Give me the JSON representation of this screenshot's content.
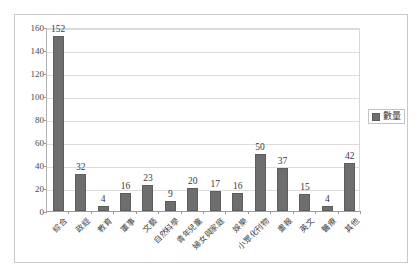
{
  "chart_data": {
    "type": "bar",
    "title": "",
    "subtitle": "",
    "xlabel": "",
    "ylabel": "",
    "ylim": [
      0,
      160
    ],
    "y_ticks": [
      0,
      20,
      40,
      60,
      80,
      100,
      120,
      140,
      160
    ],
    "grid": true,
    "legend_position": "right",
    "series_name": "數量",
    "categories": [
      "綜合",
      "政經",
      "教育",
      "軍事",
      "文藝",
      "自然科學",
      "青年兒童",
      "婦女與家庭",
      "娛樂",
      "小眾化刊物",
      "畫報",
      "英文",
      "醫療",
      "其他"
    ],
    "values": [
      152,
      32,
      4,
      16,
      23,
      9,
      20,
      17,
      16,
      50,
      37,
      15,
      4,
      42
    ],
    "series": [
      {
        "name": "數量",
        "values": [
          152,
          32,
          4,
          16,
          23,
          9,
          20,
          17,
          16,
          50,
          37,
          15,
          4,
          42
        ]
      }
    ],
    "colors": {
      "bar": "#6e6e6e",
      "bar_border": "#5d5d5d",
      "gridline": "#dcdcdc",
      "axis": "#9a9a9a",
      "frame_border": "#c9c9c9",
      "text": "#3a3a3a",
      "background": "#ffffff"
    }
  },
  "legend": {
    "label": "數量"
  }
}
